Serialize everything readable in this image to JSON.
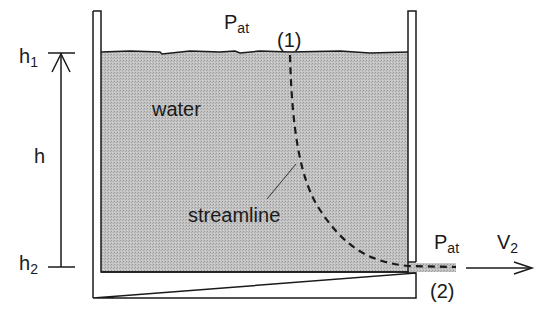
{
  "diagram": {
    "type": "tank-drain-streamline",
    "labels": {
      "top_pressure": {
        "main": "P",
        "sub": "at"
      },
      "point1": "(1)",
      "h1": {
        "main": "h",
        "sub": "1"
      },
      "h": "h",
      "h2": {
        "main": "h",
        "sub": "2"
      },
      "water": "water",
      "streamline": "streamline",
      "outlet_pressure": {
        "main": "P",
        "sub": "at"
      },
      "velocity": {
        "main": "V",
        "sub": "2"
      },
      "point2": "(2)"
    },
    "colors": {
      "water_fill": "#b9b9b9",
      "line": "#1a1a1a",
      "background": "#ffffff"
    }
  }
}
